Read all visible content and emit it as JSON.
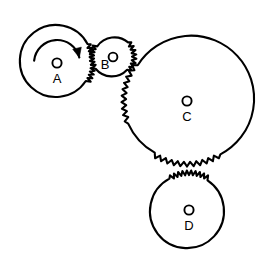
{
  "figure": {
    "background_color": "#ffffff",
    "line_color": "#000000",
    "width": 274,
    "height": 261
  },
  "gears": [
    {
      "id": "a",
      "label": "A",
      "hub_marker": "O",
      "center_x": 57,
      "center_y": 63,
      "radius": 36,
      "label_offset_x": 0,
      "label_offset_y": 17,
      "hub_offset_x": 0,
      "hub_offset_y": 0,
      "hub_radius": 4.6,
      "teeth_count": 11,
      "teeth_start_deg": -32,
      "teeth_end_deg": 32,
      "tooth_depth": 4.6
    },
    {
      "id": "b",
      "label": "B",
      "hub_marker": "O",
      "center_x": 113,
      "center_y": 57,
      "radius": 21,
      "label_offset_x": -8,
      "label_offset_y": 9,
      "hub_offset_x": 0,
      "hub_offset_y": 0,
      "hub_radius": 4.4,
      "teeth_count": 7,
      "teeth_start_deg": 146,
      "teeth_end_deg": 214,
      "tooth_depth": 4.4,
      "teeth_count_2": 8,
      "teeth_start_deg_2": -44,
      "teeth_end_deg_2": 42,
      "tooth_depth_2": 4.4
    },
    {
      "id": "c",
      "label": "C",
      "hub_marker": "O",
      "center_x": 187,
      "center_y": 101,
      "radius": 63,
      "label_offset_x": 0,
      "label_offset_y": 17,
      "hub_offset_x": 0,
      "hub_offset_y": 0,
      "hub_radius": 4.6,
      "teeth_count": 10,
      "teeth_start_deg": 159,
      "teeth_end_deg": 216,
      "tooth_depth": 4.6,
      "teeth_count_2": 11,
      "teeth_start_deg_2": 58,
      "teeth_end_deg_2": 122,
      "tooth_depth_2": 4.6
    },
    {
      "id": "d",
      "label": "D",
      "hub_marker": "O",
      "center_x": 189,
      "center_y": 210,
      "radius": 37,
      "label_offset_x": 0,
      "label_offset_y": 17,
      "hub_offset_x": 0,
      "hub_offset_y": 0,
      "hub_radius": 4.6,
      "teeth_count": 10,
      "teeth_start_deg": -122,
      "teeth_end_deg": -58,
      "tooth_depth": 4.6
    }
  ],
  "rotation_indicator": {
    "on_gear": "A",
    "direction": "clockwise",
    "center_x": 57,
    "center_y": 63,
    "radius": 23,
    "start_deg": 186,
    "end_deg": 346
  }
}
